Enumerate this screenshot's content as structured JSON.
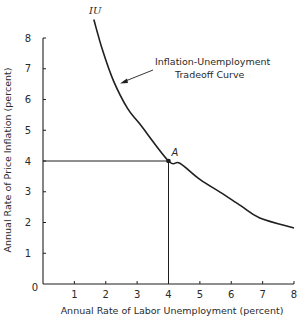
{
  "chart_data": {
    "type": "line",
    "title": "",
    "xlabel": "Annual Rate of Labor Unemployment (percent)",
    "ylabel": "Annual Rate of Price Inflation (percent)",
    "xlim": [
      0,
      8
    ],
    "ylim": [
      0,
      8
    ],
    "x_ticks": [
      "0",
      "1",
      "2",
      "3",
      "4",
      "5",
      "6",
      "7",
      "8"
    ],
    "y_ticks": [
      "0",
      "1",
      "2",
      "3",
      "4",
      "5",
      "6",
      "7",
      "8"
    ],
    "grid": false,
    "legend": null,
    "series": [
      {
        "name": "IU",
        "x": [
          1.62,
          1.9,
          2.25,
          2.7,
          3.09,
          4.0,
          4.36,
          5.0,
          5.64,
          6.3,
          6.91,
          8.0
        ],
        "values": [
          8.6,
          7.6,
          6.6,
          5.7,
          5.2,
          4.0,
          3.93,
          3.4,
          2.99,
          2.55,
          2.15,
          1.82
        ]
      }
    ],
    "annotations": [
      {
        "text": "IU",
        "type": "curve-label",
        "x": 1.65,
        "y": 8.9
      },
      {
        "text": "Inflation-Unemployment",
        "type": "arrow-label-line1"
      },
      {
        "text": "Tradeoff Curve",
        "type": "arrow-label-line2"
      },
      {
        "text": "A",
        "type": "point",
        "x": 4,
        "y": 4
      }
    ],
    "reference_lines": [
      {
        "from": [
          0,
          4
        ],
        "to": [
          4,
          4
        ],
        "orientation": "horizontal"
      },
      {
        "from": [
          4,
          0
        ],
        "to": [
          4,
          4
        ],
        "orientation": "vertical"
      }
    ]
  },
  "labels": {
    "curve_name": "IU",
    "annotation_line1": "Inflation-Unemployment",
    "annotation_line2": "Tradeoff Curve",
    "point_name": "A",
    "xlabel": "Annual Rate of Labor Unemployment (percent)",
    "ylabel": "Annual Rate of Price Inflation (percent)"
  },
  "colors": {
    "ink": "#1f1f1f",
    "background": "#ffffff"
  }
}
